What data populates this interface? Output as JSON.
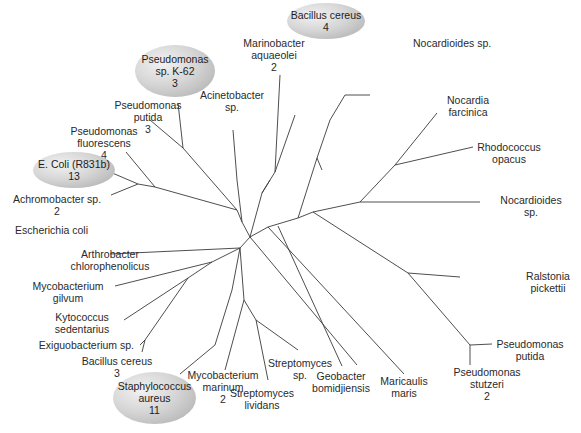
{
  "diagram": {
    "type": "unrooted phylogenetic tree",
    "line_color": "#3a3a3a",
    "highlight_fill": "#c8c8c8",
    "branches": [
      [
        250,
        237,
        268,
        227
      ],
      [
        268,
        227,
        298,
        218
      ],
      [
        298,
        218,
        313,
        212
      ],
      [
        313,
        212,
        360,
        202
      ],
      [
        298,
        218,
        317,
        158
      ],
      [
        317,
        158,
        330,
        120
      ],
      [
        317,
        158,
        322,
        170
      ],
      [
        330,
        120,
        345,
        95
      ],
      [
        345,
        95,
        370,
        95
      ],
      [
        360,
        202,
        395,
        165
      ],
      [
        395,
        165,
        437,
        113
      ],
      [
        395,
        165,
        473,
        147
      ],
      [
        360,
        202,
        480,
        202
      ],
      [
        313,
        212,
        408,
        273
      ],
      [
        408,
        273,
        460,
        277
      ],
      [
        408,
        273,
        470,
        345
      ],
      [
        470,
        345,
        470,
        365
      ],
      [
        470,
        345,
        492,
        344
      ],
      [
        250,
        237,
        242,
        222
      ],
      [
        242,
        222,
        237,
        210
      ],
      [
        237,
        210,
        155,
        187
      ],
      [
        155,
        187,
        138,
        184
      ],
      [
        138,
        184,
        110,
        172
      ],
      [
        138,
        184,
        111,
        195
      ],
      [
        155,
        187,
        126,
        152
      ],
      [
        237,
        210,
        183,
        148
      ],
      [
        183,
        148,
        150,
        120
      ],
      [
        183,
        148,
        178,
        103
      ],
      [
        242,
        222,
        237,
        180
      ],
      [
        237,
        180,
        233,
        130
      ],
      [
        250,
        237,
        262,
        193
      ],
      [
        262,
        193,
        270,
        180
      ],
      [
        262,
        193,
        275,
        172
      ],
      [
        275,
        172,
        280,
        75
      ],
      [
        275,
        172,
        295,
        115
      ],
      [
        250,
        237,
        240,
        248
      ],
      [
        240,
        248,
        110,
        254
      ],
      [
        240,
        248,
        212,
        262
      ],
      [
        212,
        262,
        115,
        286
      ],
      [
        212,
        262,
        188,
        278
      ],
      [
        188,
        278,
        124,
        320
      ],
      [
        188,
        278,
        145,
        340
      ],
      [
        145,
        340,
        140,
        345
      ],
      [
        145,
        340,
        142,
        352
      ],
      [
        240,
        248,
        232,
        290
      ],
      [
        232,
        290,
        215,
        345
      ],
      [
        215,
        345,
        180,
        374
      ],
      [
        240,
        248,
        244,
        300
      ],
      [
        244,
        300,
        225,
        370
      ],
      [
        244,
        300,
        256,
        320
      ],
      [
        256,
        320,
        268,
        380
      ],
      [
        256,
        320,
        298,
        350
      ],
      [
        250,
        237,
        357,
        365
      ],
      [
        268,
        227,
        404,
        374
      ],
      [
        278,
        226,
        342,
        366
      ]
    ],
    "labels": [
      {
        "text": "Marinobacter\naquaeolei\n2",
        "x": 274,
        "y": 37,
        "align": "center"
      },
      {
        "text": "Acinetobacter\nsp.",
        "x": 232,
        "y": 89,
        "align": "center"
      },
      {
        "text": "Pseudomonas\nputida\n3",
        "x": 148,
        "y": 99,
        "align": "center"
      },
      {
        "text": "Pseudomonas\nfluorescens\n4",
        "x": 104,
        "y": 125,
        "align": "center"
      },
      {
        "text": "Achromobacter sp.\n2",
        "x": 57,
        "y": 193,
        "align": "center"
      },
      {
        "text": "Escherichia coli",
        "x": 88,
        "y": 224,
        "align": "left"
      },
      {
        "text": "Arthrobacter\nchlorophenolicus",
        "x": 110,
        "y": 248,
        "align": "center"
      },
      {
        "text": "Mycobacterium\ngilvum",
        "x": 68,
        "y": 280,
        "align": "center"
      },
      {
        "text": "Kytococcus\nsedentarius",
        "x": 82,
        "y": 311,
        "align": "center"
      },
      {
        "text": "Exiguobacterium sp.",
        "x": 134,
        "y": 339,
        "align": "left"
      },
      {
        "text": "Bacillus cereus\n3",
        "x": 117,
        "y": 355,
        "align": "center"
      },
      {
        "text": "Mycobacterium\nmarinum\n2",
        "x": 223,
        "y": 369,
        "align": "center"
      },
      {
        "text": "Streptomyces\nlividans",
        "x": 262,
        "y": 387,
        "align": "center"
      },
      {
        "text": "Streptomyces\nsp.",
        "x": 300,
        "y": 357,
        "align": "center"
      },
      {
        "text": "Geobacter\nbomidjiensis",
        "x": 341,
        "y": 370,
        "align": "center"
      },
      {
        "text": "Maricaulis\nmaris",
        "x": 404,
        "y": 375,
        "align": "center"
      },
      {
        "text": "Pseudomonas\nstutzeri\n2",
        "x": 487,
        "y": 366,
        "align": "center"
      },
      {
        "text": "Pseudomonas\nputida",
        "x": 530,
        "y": 338,
        "align": "center"
      },
      {
        "text": "Ralstonia\npickettii",
        "x": 548,
        "y": 270,
        "align": "center"
      },
      {
        "text": "Nocardioides\nsp.",
        "x": 531,
        "y": 194,
        "align": "center"
      },
      {
        "text": "Rhodococcus\nopacus",
        "x": 509,
        "y": 141,
        "align": "center"
      },
      {
        "text": "Nocardia\nfarcinica",
        "x": 468,
        "y": 94,
        "align": "center"
      },
      {
        "text": "Nocardioides sp.",
        "x": 413,
        "y": 37,
        "align": "right"
      }
    ],
    "highlighted": [
      {
        "text": "Bacillus cereus\n4",
        "x": 287,
        "y": 3,
        "w": 78,
        "h": 36
      },
      {
        "text": "Pseudomonas\nsp. K-62\n3",
        "x": 135,
        "y": 45,
        "w": 80,
        "h": 52
      },
      {
        "text": "E. Coli (R831b)\n13",
        "x": 33,
        "y": 152,
        "w": 82,
        "h": 36
      },
      {
        "text": "Staphylococcus\naureus\n11",
        "x": 113,
        "y": 372,
        "w": 83,
        "h": 52
      }
    ]
  }
}
